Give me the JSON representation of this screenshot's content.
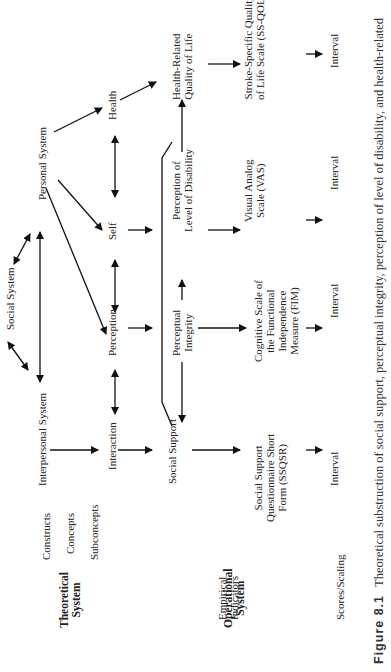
{
  "figure": {
    "label": "Figure 8.1",
    "caption": "Theoretical substruction of social support, perceptual integrity, perception of level of disability, and health-related"
  },
  "theoretical_system": {
    "title_line1": "Theoretical",
    "title_line2": "System",
    "levels": [
      "Constructs",
      "Concepts",
      "Subconcepts"
    ]
  },
  "operational_system": {
    "title_line1": "Operational",
    "title_line2": "System",
    "levels": {
      "empirical_line1": "Empirical",
      "empirical_line2": "Indicators",
      "scores": "Scores/Scaling"
    }
  },
  "constructs": {
    "social_system": "Social System",
    "interpersonal_system": "Interpersonal System",
    "personal_system": "Personal System"
  },
  "concepts": {
    "interaction": "Interaction",
    "perception": "Perception",
    "self": "Self",
    "health": "Health"
  },
  "subconcepts": {
    "social_support": "Social Support",
    "perceptual_integrity_line1": "Perceptual",
    "perceptual_integrity_line2": "Integrity",
    "perception_disability_line1": "Perception of",
    "perception_disability_line2": "Level of Disability",
    "hrqol_line1": "Health-Related",
    "hrqol_line2": "Quality of Life"
  },
  "empirical_indicators": {
    "ssqsr": [
      "Social Support",
      "Questionnaire Short",
      "Form  (SSQSR)"
    ],
    "fim": [
      "Cognitive Scale of",
      "the Functional",
      "Independence",
      "Measure (FIM)"
    ],
    "vas": [
      "Visual Analog",
      "Scale (VAS)"
    ],
    "ssqol": [
      "Stroke-Specific Quality",
      "of Life  Scale (SS-QOL)"
    ]
  },
  "scaling": {
    "ssqsr": "Interval",
    "fim": "Interval",
    "vas": "Interval",
    "ssqol": "Interval"
  }
}
